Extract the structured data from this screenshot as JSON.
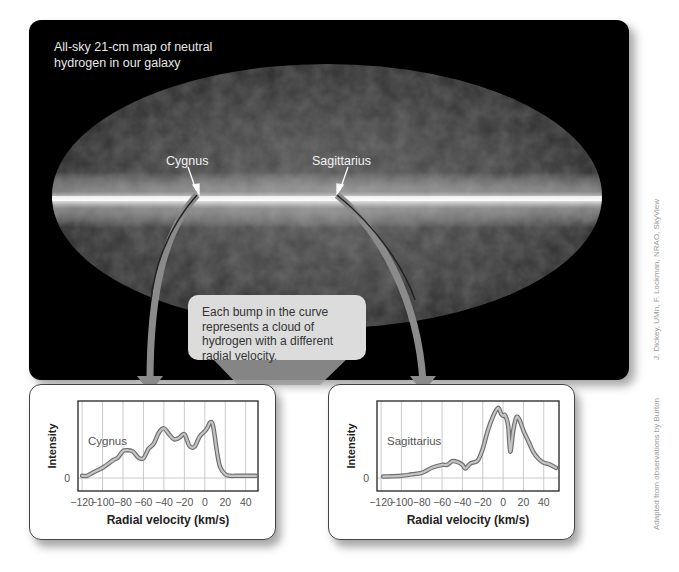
{
  "map": {
    "title": "All-sky 21-cm map of neutral hydrogen in our galaxy",
    "title_lines": [
      "All-sky 21-cm map of neutral",
      "hydrogen in our galaxy"
    ],
    "labels": {
      "cygnus": "Cygnus",
      "sagittarius": "Sagittarius"
    }
  },
  "callout": {
    "text": "Each bump in the curve represents a cloud of hydrogen with a different radial velocity."
  },
  "colors": {
    "panel_bg": "#000000",
    "arrow": "#8a8a8a",
    "callout_bg": "#dcdcdc",
    "curve": "#9a9a9a",
    "grid": "#bdbdbd"
  },
  "credits": {
    "map": "J. Dickey, UMn, F. Lockman, NRAO, SkyView",
    "plots": "Adapted from observations by Burton"
  },
  "chart_data": [
    {
      "type": "line",
      "title": "Cygnus",
      "xlabel": "Radial velocity (km/s)",
      "ylabel": "Intensity",
      "x_ticks": [
        -120,
        -100,
        -80,
        -60,
        -40,
        -20,
        0,
        20,
        40
      ],
      "y_ticks": [
        0
      ],
      "xlim": [
        -124,
        50
      ],
      "grid": true,
      "x": [
        -120,
        -115,
        -110,
        -100,
        -90,
        -85,
        -80,
        -75,
        -70,
        -65,
        -60,
        -55,
        -50,
        -45,
        -40,
        -35,
        -30,
        -25,
        -20,
        -15,
        -10,
        -5,
        0,
        3,
        5,
        8,
        12,
        15,
        20,
        25,
        30,
        40,
        50
      ],
      "values": [
        0.03,
        0.03,
        0.07,
        0.14,
        0.24,
        0.28,
        0.37,
        0.38,
        0.36,
        0.28,
        0.27,
        0.4,
        0.47,
        0.62,
        0.68,
        0.6,
        0.53,
        0.55,
        0.6,
        0.44,
        0.43,
        0.57,
        0.64,
        0.7,
        0.76,
        0.72,
        0.35,
        0.15,
        0.05,
        0.03,
        0.03,
        0.03,
        0.03
      ]
    },
    {
      "type": "line",
      "title": "Sagittarius",
      "xlabel": "Radial velocity (km/s)",
      "ylabel": "Intensity",
      "x_ticks": [
        -120,
        -100,
        -80,
        -60,
        -40,
        -20,
        0,
        20,
        40
      ],
      "y_ticks": [
        0
      ],
      "xlim": [
        -124,
        55
      ],
      "grid": true,
      "x": [
        -118,
        -100,
        -90,
        -80,
        -70,
        -60,
        -55,
        -50,
        -45,
        -40,
        -37,
        -32,
        -25,
        -20,
        -15,
        -10,
        -5,
        -2,
        0,
        2,
        5,
        7,
        10,
        13,
        16,
        20,
        25,
        30,
        35,
        40,
        45,
        52
      ],
      "values": [
        0.02,
        0.03,
        0.05,
        0.07,
        0.14,
        0.18,
        0.18,
        0.23,
        0.22,
        0.18,
        0.13,
        0.2,
        0.24,
        0.4,
        0.65,
        0.84,
        0.96,
        0.88,
        0.85,
        0.86,
        0.72,
        0.36,
        0.65,
        0.83,
        0.8,
        0.65,
        0.5,
        0.35,
        0.26,
        0.21,
        0.19,
        0.14
      ]
    }
  ]
}
